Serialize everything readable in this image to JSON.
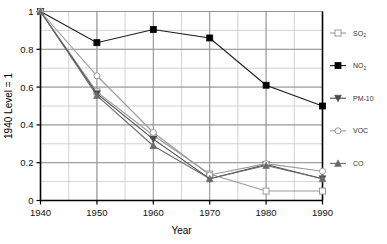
{
  "chart_data": {
    "type": "line",
    "title": "",
    "subtitle": "",
    "xlabel": "Year",
    "ylabel": "1940 Level = 1",
    "x": [
      1940,
      1950,
      1960,
      1970,
      1980,
      1990
    ],
    "xticklabels": [
      "1940",
      "1950",
      "1960",
      "1970",
      "1980",
      "1990"
    ],
    "yticklabels": [
      "0",
      "0.2",
      "0.4",
      "0.6",
      "0.8",
      "1"
    ],
    "ytickvalues": [
      0,
      0.2,
      0.4,
      0.6,
      0.8,
      1
    ],
    "xlim": [
      1940,
      1990
    ],
    "ylim": [
      0,
      1
    ],
    "grid": "both-major-and-minor",
    "minor_y_step": 0.1,
    "minor_x_step": 5,
    "legend_position": "right-outside",
    "series": [
      {
        "name": "SO2",
        "label": "SO",
        "label_sub": "2",
        "marker": "open-square",
        "color": "#9a9a9a",
        "values": [
          1.0,
          0.575,
          0.345,
          0.14,
          0.05,
          0.05
        ]
      },
      {
        "name": "NO2",
        "label": "NO",
        "label_sub": "2",
        "marker": "filled-square",
        "color": "#1a1a1a",
        "values": [
          1.0,
          0.835,
          0.905,
          0.86,
          0.61,
          0.5
        ]
      },
      {
        "name": "PM-10",
        "label": "PM-10",
        "label_sub": "",
        "marker": "filled-down-triangle",
        "color": "#4a4a4a",
        "values": [
          1.0,
          0.565,
          0.325,
          0.115,
          0.19,
          0.115
        ]
      },
      {
        "name": "VOC",
        "label": "VOC",
        "label_sub": "",
        "marker": "open-circle",
        "color": "#9a9a9a",
        "values": [
          1.0,
          0.66,
          0.36,
          0.135,
          0.195,
          0.155
        ]
      },
      {
        "name": "CO",
        "label": "CO",
        "label_sub": "",
        "marker": "filled-up-triangle",
        "color": "#6a6a6a",
        "values": [
          1.0,
          0.555,
          0.29,
          0.115,
          0.185,
          0.115
        ]
      }
    ]
  },
  "axes": {
    "y_axis_title": "1940 Level = 1",
    "x_axis_title": "Year"
  },
  "colors": {
    "plot_background": "#ffffff",
    "grid_major": "#8c8c8c",
    "grid_minor": "#c8c8c8",
    "axis": "#000000"
  }
}
